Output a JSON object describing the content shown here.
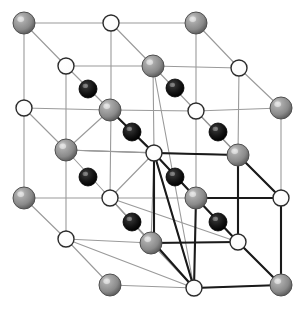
{
  "figure": {
    "width": 305,
    "height": 310,
    "background_color": "#ffffff"
  },
  "palette": {
    "gray_sphere_fill": "#8c8c8c",
    "gray_sphere_highlight": "#d8d8d8",
    "gray_sphere_shadow": "#5a5a5a",
    "gray_sphere_stroke": "#4f4f4f",
    "black_sphere_fill": "#141414",
    "black_sphere_highlight": "#6e6e6e",
    "black_sphere_stroke": "#000000",
    "white_sphere_fill": "#ffffff",
    "white_sphere_stroke": "#2b2b2b",
    "edge_light": "#9a9a9a",
    "edge_mid": "#6a6a6a",
    "edge_dark": "#1a1a1a"
  },
  "legend": {
    "species": [
      {
        "name": "gray-atom",
        "label": "Gray sphere atom",
        "color": "#8c8c8c",
        "radius": 11
      },
      {
        "name": "white-atom",
        "label": "White circle atom",
        "color": "#ffffff",
        "radius": 8
      },
      {
        "name": "black-atom",
        "label": "Black sphere atom",
        "color": "#141414",
        "radius": 9
      }
    ]
  },
  "lattice": {
    "projection": "oblique cubic, depth offset (-43, +43)",
    "front_origin": {
      "x": 66,
      "y": 66
    },
    "cell_step": 88,
    "depth_dx": -43,
    "depth_dy": 43
  },
  "edges_light": [
    {
      "x1": 24,
      "y1": 23,
      "x2": 111,
      "y2": 23
    },
    {
      "x1": 111,
      "y1": 23,
      "x2": 196,
      "y2": 23
    },
    {
      "x1": 24,
      "y1": 23,
      "x2": 24,
      "y2": 108
    },
    {
      "x1": 24,
      "y1": 108,
      "x2": 24,
      "y2": 198
    },
    {
      "x1": 196,
      "y1": 23,
      "x2": 196,
      "y2": 111
    },
    {
      "x1": 196,
      "y1": 111,
      "x2": 196,
      "y2": 198
    },
    {
      "x1": 24,
      "y1": 108,
      "x2": 110,
      "y2": 110
    },
    {
      "x1": 110,
      "y1": 110,
      "x2": 196,
      "y2": 111
    },
    {
      "x1": 24,
      "y1": 198,
      "x2": 110,
      "y2": 198
    },
    {
      "x1": 110,
      "y1": 198,
      "x2": 196,
      "y2": 198
    },
    {
      "x1": 111,
      "y1": 23,
      "x2": 111,
      "y2": 110
    },
    {
      "x1": 111,
      "y1": 110,
      "x2": 110,
      "y2": 198
    },
    {
      "x1": 66,
      "y1": 66,
      "x2": 153,
      "y2": 66
    },
    {
      "x1": 153,
      "y1": 66,
      "x2": 239,
      "y2": 68
    },
    {
      "x1": 66,
      "y1": 66,
      "x2": 66,
      "y2": 150
    },
    {
      "x1": 66,
      "y1": 150,
      "x2": 66,
      "y2": 239
    },
    {
      "x1": 153,
      "y1": 66,
      "x2": 154,
      "y2": 153
    },
    {
      "x1": 239,
      "y1": 68,
      "x2": 238,
      "y2": 155
    },
    {
      "x1": 238,
      "y1": 155,
      "x2": 238,
      "y2": 242
    },
    {
      "x1": 66,
      "y1": 150,
      "x2": 154,
      "y2": 153
    },
    {
      "x1": 154,
      "y1": 153,
      "x2": 238,
      "y2": 155
    },
    {
      "x1": 66,
      "y1": 239,
      "x2": 151,
      "y2": 243
    },
    {
      "x1": 151,
      "y1": 243,
      "x2": 238,
      "y2": 242
    },
    {
      "x1": 154,
      "y1": 153,
      "x2": 151,
      "y2": 243
    },
    {
      "x1": 24,
      "y1": 23,
      "x2": 66,
      "y2": 66
    },
    {
      "x1": 111,
      "y1": 23,
      "x2": 153,
      "y2": 66
    },
    {
      "x1": 196,
      "y1": 23,
      "x2": 239,
      "y2": 68
    },
    {
      "x1": 24,
      "y1": 108,
      "x2": 66,
      "y2": 150
    },
    {
      "x1": 110,
      "y1": 110,
      "x2": 154,
      "y2": 153
    },
    {
      "x1": 196,
      "y1": 111,
      "x2": 238,
      "y2": 155
    },
    {
      "x1": 24,
      "y1": 198,
      "x2": 66,
      "y2": 239
    },
    {
      "x1": 110,
      "y1": 198,
      "x2": 151,
      "y2": 243
    },
    {
      "x1": 196,
      "y1": 198,
      "x2": 238,
      "y2": 242
    },
    {
      "x1": 66,
      "y1": 66,
      "x2": 110,
      "y2": 110
    },
    {
      "x1": 110,
      "y1": 110,
      "x2": 153,
      "y2": 153
    },
    {
      "x1": 153,
      "y1": 66,
      "x2": 196,
      "y2": 111
    },
    {
      "x1": 196,
      "y1": 111,
      "x2": 238,
      "y2": 155
    },
    {
      "x1": 66,
      "y1": 150,
      "x2": 110,
      "y2": 198
    },
    {
      "x1": 110,
      "y1": 198,
      "x2": 151,
      "y2": 243
    },
    {
      "x1": 154,
      "y1": 153,
      "x2": 196,
      "y2": 198
    },
    {
      "x1": 196,
      "y1": 198,
      "x2": 238,
      "y2": 242
    },
    {
      "x1": 66,
      "y1": 239,
      "x2": 110,
      "y2": 285
    },
    {
      "x1": 151,
      "y1": 243,
      "x2": 194,
      "y2": 288
    },
    {
      "x1": 238,
      "y1": 242,
      "x2": 281,
      "y2": 285
    },
    {
      "x1": 110,
      "y1": 285,
      "x2": 194,
      "y2": 288
    },
    {
      "x1": 194,
      "y1": 288,
      "x2": 281,
      "y2": 285
    },
    {
      "x1": 281,
      "y1": 108,
      "x2": 281,
      "y2": 198
    },
    {
      "x1": 281,
      "y1": 198,
      "x2": 281,
      "y2": 285
    },
    {
      "x1": 239,
      "y1": 68,
      "x2": 281,
      "y2": 108
    },
    {
      "x1": 238,
      "y1": 155,
      "x2": 281,
      "y2": 198
    },
    {
      "x1": 196,
      "y1": 111,
      "x2": 281,
      "y2": 108
    },
    {
      "x1": 196,
      "y1": 198,
      "x2": 281,
      "y2": 198
    },
    {
      "x1": 110,
      "y1": 110,
      "x2": 66,
      "y2": 150
    },
    {
      "x1": 154,
      "y1": 153,
      "x2": 110,
      "y2": 198
    },
    {
      "x1": 66,
      "y1": 150,
      "x2": 154,
      "y2": 153
    },
    {
      "x1": 110,
      "y1": 198,
      "x2": 194,
      "y2": 288
    },
    {
      "x1": 66,
      "y1": 239,
      "x2": 194,
      "y2": 288
    },
    {
      "x1": 154,
      "y1": 153,
      "x2": 194,
      "y2": 288
    },
    {
      "x1": 153,
      "y1": 66,
      "x2": 194,
      "y2": 288
    },
    {
      "x1": 110,
      "y1": 198,
      "x2": 238,
      "y2": 242
    },
    {
      "x1": 66,
      "y1": 150,
      "x2": 238,
      "y2": 155
    }
  ],
  "edges_dark": [
    {
      "x1": 154,
      "y1": 153,
      "x2": 238,
      "y2": 155
    },
    {
      "x1": 238,
      "y1": 155,
      "x2": 281,
      "y2": 198
    },
    {
      "x1": 154,
      "y1": 153,
      "x2": 154,
      "y2": 243
    },
    {
      "x1": 238,
      "y1": 155,
      "x2": 238,
      "y2": 242
    },
    {
      "x1": 281,
      "y1": 198,
      "x2": 281,
      "y2": 285
    },
    {
      "x1": 154,
      "y1": 243,
      "x2": 194,
      "y2": 288
    },
    {
      "x1": 238,
      "y1": 242,
      "x2": 281,
      "y2": 285
    },
    {
      "x1": 194,
      "y1": 288,
      "x2": 281,
      "y2": 285
    },
    {
      "x1": 154,
      "y1": 153,
      "x2": 194,
      "y2": 288
    },
    {
      "x1": 196,
      "y1": 198,
      "x2": 238,
      "y2": 242
    },
    {
      "x1": 196,
      "y1": 198,
      "x2": 281,
      "y2": 198
    },
    {
      "x1": 196,
      "y1": 198,
      "x2": 194,
      "y2": 288
    },
    {
      "x1": 151,
      "y1": 243,
      "x2": 238,
      "y2": 242
    },
    {
      "x1": 110,
      "y1": 110,
      "x2": 154,
      "y2": 153
    },
    {
      "x1": 154,
      "y1": 153,
      "x2": 196,
      "y2": 198
    }
  ],
  "atoms": {
    "gray": [
      {
        "id": "gray-1",
        "x": 24,
        "y": 23,
        "r": 11
      },
      {
        "id": "gray-2",
        "x": 196,
        "y": 23,
        "r": 11
      },
      {
        "id": "gray-3",
        "x": 153,
        "y": 66,
        "r": 11
      },
      {
        "id": "gray-4",
        "x": 110,
        "y": 110,
        "r": 11
      },
      {
        "id": "gray-5",
        "x": 281,
        "y": 108,
        "r": 11
      },
      {
        "id": "gray-6",
        "x": 66,
        "y": 150,
        "r": 11
      },
      {
        "id": "gray-7",
        "x": 238,
        "y": 155,
        "r": 11
      },
      {
        "id": "gray-8",
        "x": 24,
        "y": 198,
        "r": 11
      },
      {
        "id": "gray-9",
        "x": 196,
        "y": 198,
        "r": 11
      },
      {
        "id": "gray-10",
        "x": 151,
        "y": 243,
        "r": 11
      },
      {
        "id": "gray-11",
        "x": 110,
        "y": 285,
        "r": 11
      },
      {
        "id": "gray-12",
        "x": 281,
        "y": 285,
        "r": 11
      }
    ],
    "white": [
      {
        "id": "white-1",
        "x": 111,
        "y": 23,
        "r": 8
      },
      {
        "id": "white-2",
        "x": 66,
        "y": 66,
        "r": 8
      },
      {
        "id": "white-3",
        "x": 239,
        "y": 68,
        "r": 8
      },
      {
        "id": "white-4",
        "x": 24,
        "y": 108,
        "r": 8
      },
      {
        "id": "white-5",
        "x": 196,
        "y": 111,
        "r": 8
      },
      {
        "id": "white-6",
        "x": 154,
        "y": 153,
        "r": 8
      },
      {
        "id": "white-7",
        "x": 110,
        "y": 198,
        "r": 8
      },
      {
        "id": "white-8",
        "x": 281,
        "y": 198,
        "r": 8
      },
      {
        "id": "white-9",
        "x": 66,
        "y": 239,
        "r": 8
      },
      {
        "id": "white-10",
        "x": 238,
        "y": 242,
        "r": 8
      },
      {
        "id": "white-11",
        "x": 194,
        "y": 288,
        "r": 8
      }
    ],
    "black": [
      {
        "id": "black-1",
        "x": 88,
        "y": 89,
        "r": 9
      },
      {
        "id": "black-2",
        "x": 175,
        "y": 88,
        "r": 9
      },
      {
        "id": "black-3",
        "x": 132,
        "y": 132,
        "r": 9
      },
      {
        "id": "black-4",
        "x": 218,
        "y": 132,
        "r": 9
      },
      {
        "id": "black-5",
        "x": 88,
        "y": 177,
        "r": 9
      },
      {
        "id": "black-6",
        "x": 175,
        "y": 177,
        "r": 9
      },
      {
        "id": "black-7",
        "x": 132,
        "y": 222,
        "r": 9
      },
      {
        "id": "black-8",
        "x": 218,
        "y": 222,
        "r": 9
      }
    ]
  }
}
